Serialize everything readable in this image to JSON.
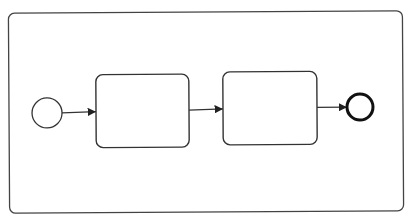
{
  "diagram": {
    "type": "bpmn-process",
    "colors": {
      "background": "#ffffff",
      "stroke": "#333333",
      "pool_stroke": "#444444",
      "fill": "#ffffff"
    },
    "pool": {
      "label": "",
      "x": 9,
      "y": 12,
      "width": 394,
      "height": 200,
      "rx": 6
    },
    "nodes": [
      {
        "id": "start-event",
        "kind": "start-event",
        "label": "",
        "cx": 47,
        "cy": 112,
        "r": 15,
        "stroke_width": 1.3
      },
      {
        "id": "task-1",
        "kind": "task",
        "label": "",
        "x": 96,
        "y": 74,
        "width": 93,
        "height": 73,
        "rx": 7
      },
      {
        "id": "task-2",
        "kind": "task",
        "label": "",
        "x": 223,
        "y": 72,
        "width": 94,
        "height": 73,
        "rx": 7
      },
      {
        "id": "end-event",
        "kind": "end-event",
        "label": "",
        "cx": 360,
        "cy": 108,
        "r": 13,
        "stroke_width": 3
      }
    ],
    "flows": [
      {
        "id": "flow-1",
        "from": "start-event",
        "to": "task-1",
        "x1": 62,
        "y1": 112,
        "x2": 96,
        "y2": 111
      },
      {
        "id": "flow-2",
        "from": "task-1",
        "to": "task-2",
        "x1": 189,
        "y1": 110,
        "x2": 223,
        "y2": 109
      },
      {
        "id": "flow-3",
        "from": "task-2",
        "to": "end-event",
        "x1": 317,
        "y1": 108,
        "x2": 347,
        "y2": 108
      }
    ]
  }
}
